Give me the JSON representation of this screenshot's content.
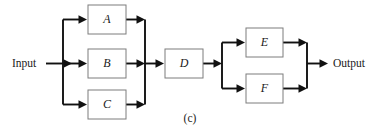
{
  "figure": {
    "caption": "(c)",
    "input_label": "Input",
    "output_label": "Output",
    "colors": {
      "background": "#ffffff",
      "block_border": "#7d7d7d",
      "block_fill": "#ffffff",
      "wire": "#111111",
      "text": "#1a1a1a"
    },
    "blocks": [
      {
        "id": "A",
        "label": "A",
        "x": 88,
        "y": 5,
        "w": 38,
        "h": 29
      },
      {
        "id": "B",
        "label": "B",
        "x": 88,
        "y": 49,
        "w": 38,
        "h": 29
      },
      {
        "id": "C",
        "label": "C",
        "x": 88,
        "y": 90,
        "w": 38,
        "h": 29
      },
      {
        "id": "D",
        "label": "D",
        "x": 165,
        "y": 49,
        "w": 38,
        "h": 29
      },
      {
        "id": "E",
        "label": "E",
        "x": 246,
        "y": 28,
        "w": 37,
        "h": 29
      },
      {
        "id": "F",
        "label": "F",
        "x": 246,
        "y": 74,
        "w": 37,
        "h": 29
      }
    ],
    "topology": {
      "description": "Input feeds a parallel group of A, B and C; their outputs merge into D; D feeds a parallel group of E and F whose outputs merge into Output.",
      "parallel_group_1": [
        "A",
        "B",
        "C"
      ],
      "series_block": "D",
      "parallel_group_2": [
        "E",
        "F"
      ]
    }
  }
}
